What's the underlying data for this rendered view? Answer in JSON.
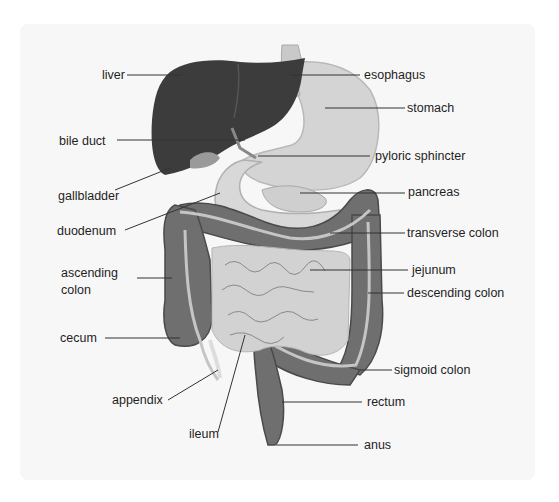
{
  "diagram": {
    "type": "anatomical-illustration",
    "colors": {
      "background_panel": "#f7f7f7",
      "liver": "#3b3b3b",
      "stomach": "#d6d6d6",
      "large_intestine": "#6e6e6e",
      "small_intestine": "#d0d0d0",
      "leader_line": "#333333"
    },
    "labels": {
      "liver": "liver",
      "bile_duct": "bile duct",
      "gallbladder": "gallbladder",
      "duodenum": "duodenum",
      "ascending_colon_1": "ascending",
      "ascending_colon_2": "colon",
      "cecum": "cecum",
      "appendix": "appendix",
      "ileum": "ileum",
      "esophagus": "esophagus",
      "stomach": "stomach",
      "pyloric_sphincter": "pyloric sphincter",
      "pancreas": "pancreas",
      "transverse_colon": "transverse colon",
      "jejunum": "jejunum",
      "descending_colon": "descending colon",
      "sigmoid_colon": "sigmoid colon",
      "rectum": "rectum",
      "anus": "anus"
    }
  }
}
